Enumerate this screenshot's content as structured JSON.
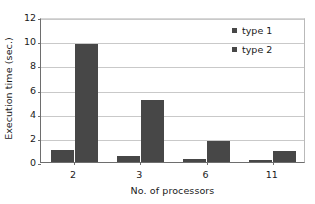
{
  "chart_data": {
    "type": "bar",
    "title": "",
    "subtitle": "",
    "xlabel": "No. of processors",
    "ylabel": "Execution time (sec.)",
    "categories": [
      "2",
      "3",
      "6",
      "11"
    ],
    "series": [
      {
        "name": "type 1",
        "values": [
          1.0,
          0.5,
          0.25,
          0.2
        ],
        "color": "#474747"
      },
      {
        "name": "type 2",
        "values": [
          9.8,
          5.15,
          1.75,
          0.9
        ],
        "color": "#474747"
      }
    ],
    "ylim": [
      0,
      12
    ],
    "yticks": [
      0,
      2,
      4,
      6,
      8,
      10,
      12
    ],
    "ytick_labels": [
      "0",
      "2",
      "4",
      "6",
      "8",
      "10",
      "12"
    ],
    "xtick_labels": [
      "2",
      "3",
      "6",
      "11"
    ],
    "grid": "horizontal",
    "legend_position": "top-right",
    "annotations": []
  },
  "colors": {
    "bar": "#474747",
    "gridline": "#c9c9c9",
    "axis": "#6e6e6e",
    "text": "#1a1a1a",
    "plot_background": "#ffffff"
  },
  "legend": {
    "items": [
      {
        "label": "type 1"
      },
      {
        "label": "type 2"
      }
    ]
  }
}
